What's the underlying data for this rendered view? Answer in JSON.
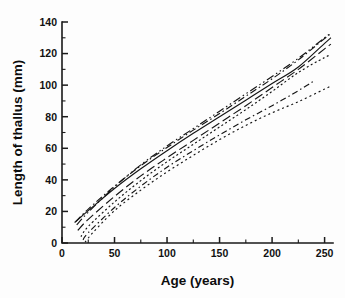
{
  "figure": {
    "background_color": "#fdfdfd",
    "foreground_color": "#151515"
  },
  "chart_data": {
    "type": "line",
    "title": "",
    "subtitle": "",
    "xlabel": "Age (years)",
    "ylabel": "Length of thallus (mm)",
    "xlim": [
      0,
      258
    ],
    "ylim": [
      0,
      140
    ],
    "xticks": [
      0,
      50,
      100,
      150,
      200,
      250
    ],
    "yticks": [
      0,
      20,
      40,
      60,
      80,
      100,
      120,
      140
    ],
    "xtick_labels": [
      "0",
      "50",
      "100",
      "150",
      "200",
      "250"
    ],
    "ytick_labels": [
      "0",
      "20",
      "40",
      "60",
      "80",
      "100",
      "120",
      "140"
    ],
    "x_minor_tick_interval": 25,
    "y_minor_tick_interval": 10,
    "grid": false,
    "legend": null,
    "legend_position": "none",
    "annotations": [],
    "series": [
      {
        "name": "curve-1-solid",
        "linestyle": "solid",
        "dash_pattern": "none",
        "x": [
          12,
          25,
          50,
          75,
          100,
          125,
          150,
          175,
          200,
          225,
          250,
          256
        ],
        "y": [
          13.0,
          20.5,
          34.5,
          47.0,
          58.5,
          69.5,
          80.0,
          90.5,
          101.0,
          111.5,
          126.5,
          130.0
        ]
      },
      {
        "name": "curve-2-dash-dot",
        "linestyle": "dashdot",
        "dash_pattern": "7 3 1.5 3",
        "x": [
          13,
          25,
          50,
          75,
          100,
          125,
          150,
          175,
          200,
          225,
          250,
          256
        ],
        "y": [
          13.5,
          21.5,
          36.0,
          49.0,
          60.5,
          71.5,
          82.0,
          93.0,
          104.0,
          116.0,
          129.5,
          132.5
        ]
      },
      {
        "name": "curve-3-dash-dot-dot",
        "linestyle": "dashdotdot",
        "dash_pattern": "8 3 1.5 3 1.5 3",
        "x": [
          14,
          25,
          50,
          75,
          100,
          125,
          150,
          175,
          200,
          225,
          250,
          256
        ],
        "y": [
          11.5,
          19.5,
          35.5,
          49.5,
          61.5,
          72.5,
          83.5,
          94.5,
          105.5,
          117.0,
          130.0,
          133.0
        ]
      },
      {
        "name": "curve-4-long-dash",
        "linestyle": "dashed",
        "dash_pattern": "9 4",
        "x": [
          15,
          25,
          50,
          75,
          100,
          125,
          150,
          175,
          200,
          225,
          250,
          256
        ],
        "y": [
          8.0,
          15.0,
          29.5,
          42.5,
          54.0,
          65.0,
          76.0,
          87.0,
          98.5,
          110.0,
          123.0,
          126.0
        ]
      },
      {
        "name": "curve-5-dotted-upper",
        "linestyle": "dotted",
        "dash_pattern": "2 2.5",
        "x": [
          18,
          25,
          50,
          75,
          100,
          125,
          150,
          175,
          200,
          225,
          250,
          256
        ],
        "y": [
          4.0,
          10.5,
          26.0,
          39.5,
          51.5,
          62.5,
          73.5,
          84.5,
          96.0,
          108.0,
          117.5,
          119.0
        ]
      },
      {
        "name": "curve-6-dash-dot-lower",
        "linestyle": "dashdot",
        "dash_pattern": "6 3 1.5 3",
        "x": [
          20,
          25,
          50,
          75,
          100,
          125,
          150,
          175,
          200,
          225,
          237,
          240
        ],
        "y": [
          2.0,
          6.5,
          22.5,
          36.0,
          48.0,
          58.5,
          68.5,
          78.0,
          87.0,
          96.5,
          101.5,
          102.5
        ]
      },
      {
        "name": "curve-7-dotted-lowest",
        "linestyle": "dotted",
        "dash_pattern": "2 3",
        "x": [
          22,
          30,
          50,
          75,
          100,
          125,
          150,
          175,
          200,
          225,
          250,
          256
        ],
        "y": [
          0.5,
          7.0,
          20.5,
          33.5,
          45.0,
          55.5,
          65.5,
          74.5,
          82.5,
          89.5,
          97.5,
          99.5
        ]
      }
    ]
  }
}
